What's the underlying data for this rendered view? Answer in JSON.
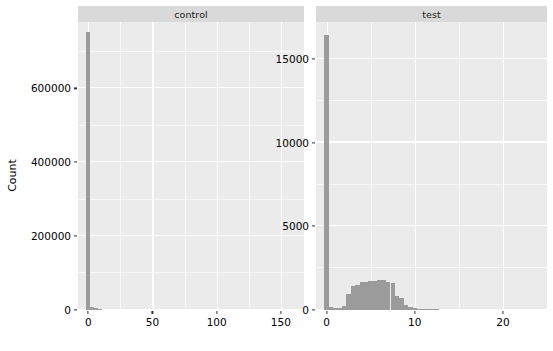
{
  "chart_data": {
    "type": "bar",
    "title": "",
    "subtitle": "",
    "xlabel": "",
    "ylabel": "Count",
    "grid": true,
    "legend": false,
    "facet_layout": "1 row x 2 columns, free x and y scales",
    "panels": [
      {
        "strip_label": "control",
        "xlabel": "",
        "ylabel": "Count",
        "xlim": [
          -8,
          168
        ],
        "ylim": [
          0,
          780000
        ],
        "x_ticks": [
          "0",
          "50",
          "100",
          "150"
        ],
        "x_tick_values": [
          0,
          50,
          100,
          150
        ],
        "x_minor_values": [
          25,
          75,
          125
        ],
        "y_ticks": [
          "0",
          "200000",
          "400000",
          "600000"
        ],
        "y_tick_values": [
          0,
          200000,
          400000,
          600000
        ],
        "y_minor_values": [
          100000,
          300000,
          500000,
          700000
        ],
        "bin_width": 3,
        "bars": [
          {
            "x": 0,
            "value": 752000
          },
          {
            "x": 3,
            "value": 9000
          },
          {
            "x": 6,
            "value": 6000
          },
          {
            "x": 9,
            "value": 2500
          }
        ]
      },
      {
        "strip_label": "test",
        "xlabel": "",
        "ylabel": "",
        "xlim": [
          -1.2,
          25
        ],
        "ylim": [
          0,
          17200
        ],
        "x_ticks": [
          "0",
          "10",
          "20"
        ],
        "x_tick_values": [
          0,
          10,
          20
        ],
        "x_minor_values": [
          5,
          15
        ],
        "y_ticks": [
          "0",
          "5000",
          "10000",
          "15000"
        ],
        "y_tick_values": [
          0,
          5000,
          10000,
          15000
        ],
        "y_minor_values": [
          2500,
          7500,
          12500
        ],
        "bin_width": 0.5,
        "bars": [
          {
            "x": 0.0,
            "value": 16400
          },
          {
            "x": 0.5,
            "value": 180
          },
          {
            "x": 1.0,
            "value": 120
          },
          {
            "x": 1.5,
            "value": 110
          },
          {
            "x": 2.0,
            "value": 230
          },
          {
            "x": 2.5,
            "value": 980
          },
          {
            "x": 3.0,
            "value": 1420
          },
          {
            "x": 3.5,
            "value": 1500
          },
          {
            "x": 4.0,
            "value": 1650
          },
          {
            "x": 4.5,
            "value": 1680
          },
          {
            "x": 5.0,
            "value": 1720
          },
          {
            "x": 5.5,
            "value": 1760
          },
          {
            "x": 6.0,
            "value": 1800
          },
          {
            "x": 6.5,
            "value": 1820
          },
          {
            "x": 7.0,
            "value": 1700
          },
          {
            "x": 7.5,
            "value": 1640
          },
          {
            "x": 8.0,
            "value": 820
          },
          {
            "x": 8.5,
            "value": 700
          },
          {
            "x": 9.0,
            "value": 300
          },
          {
            "x": 9.5,
            "value": 180
          },
          {
            "x": 10.0,
            "value": 110
          },
          {
            "x": 10.5,
            "value": 70
          },
          {
            "x": 11.0,
            "value": 45
          },
          {
            "x": 11.5,
            "value": 30
          },
          {
            "x": 12.0,
            "value": 18
          },
          {
            "x": 12.5,
            "value": 10
          }
        ]
      }
    ],
    "colors": {
      "bar_fill": "#9b9b9b",
      "panel_background": "#ebebeb",
      "strip_background": "#d9d9d9",
      "gridline": "#ffffff",
      "text": "#000000",
      "figure_background": "#ffffff"
    }
  }
}
